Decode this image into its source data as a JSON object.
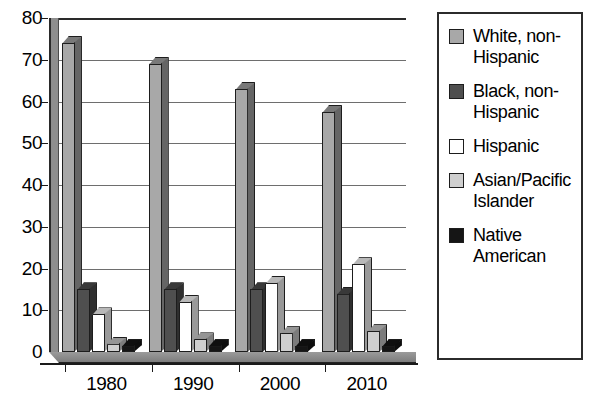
{
  "chart_data": {
    "type": "bar",
    "title": "",
    "xlabel": "",
    "ylabel": "",
    "ylim": [
      0,
      80
    ],
    "ytick_step": 10,
    "yticks": [
      "80",
      "70",
      "60",
      "50",
      "40",
      "30",
      "20",
      "10",
      "0"
    ],
    "grid": true,
    "legend_position": "right",
    "style": "3d-clustered-bar",
    "categories": [
      "1980",
      "1990",
      "2000",
      "2010"
    ],
    "series": [
      {
        "name": "White, non-\nHispanic",
        "color": "#a8a8a8",
        "values": [
          74,
          69,
          63,
          57.5
        ]
      },
      {
        "name": "Black, non-\nHispanic",
        "color": "#4f4f4f",
        "values": [
          15,
          15,
          15,
          14
        ]
      },
      {
        "name": "Hispanic",
        "color": "#ffffff",
        "values": [
          9,
          12,
          16.5,
          21
        ]
      },
      {
        "name": "Asian/Pacific\nIslander",
        "color": "#cfcfcf",
        "values": [
          2,
          3,
          4.5,
          5
        ]
      },
      {
        "name": "Native\nAmerican",
        "color": "#151515",
        "values": [
          1.5,
          1.5,
          1.5,
          1.5
        ]
      }
    ]
  },
  "legend": {
    "items": [
      {
        "label": "White, non-\nHispanic",
        "swatch": "#a8a8a8"
      },
      {
        "label": "Black, non-\nHispanic",
        "swatch": "#4f4f4f"
      },
      {
        "label": "Hispanic",
        "swatch": "#ffffff"
      },
      {
        "label": "Asian/Pacific\nIslander",
        "swatch": "#cfcfcf"
      },
      {
        "label": "Native\nAmerican",
        "swatch": "#151515"
      }
    ]
  }
}
